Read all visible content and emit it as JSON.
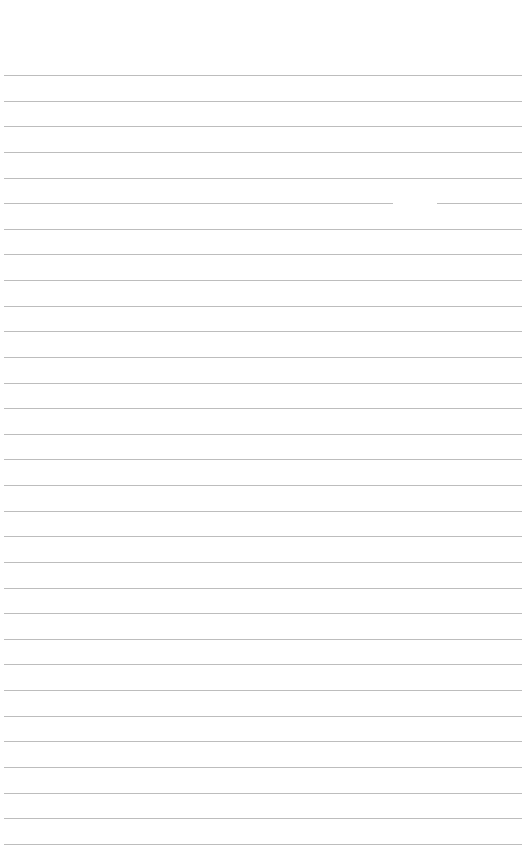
{
  "page": {
    "background": "#ffffff",
    "line_color": "#bdbdbd",
    "line_count": 31,
    "first_line_y": 75,
    "line_spacing": 25.63,
    "line_left": 4,
    "line_right": 522,
    "gaps": [
      {
        "line_index": 5,
        "x_start": 393,
        "x_end": 437
      }
    ]
  }
}
